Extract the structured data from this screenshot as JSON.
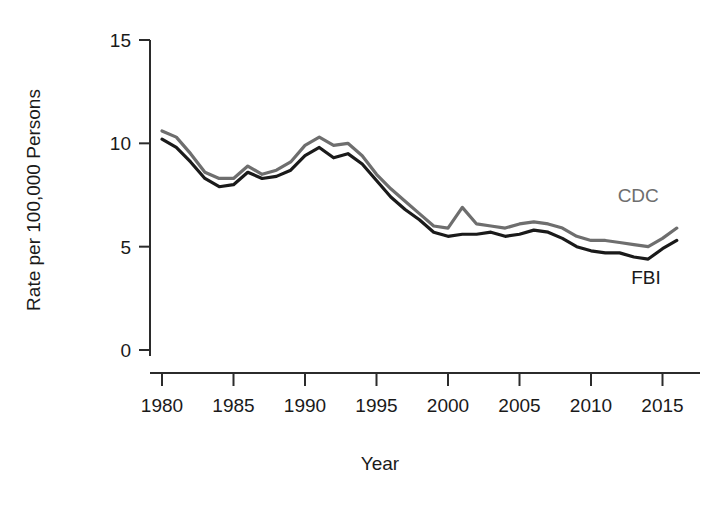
{
  "chart_data": {
    "type": "line",
    "title": "",
    "xlabel": "Year",
    "ylabel": "Rate per 100,000 Persons",
    "xlim": [
      1980,
      2016
    ],
    "ylim": [
      0,
      15
    ],
    "xticks": [
      1980,
      1985,
      1990,
      1995,
      2000,
      2005,
      2010,
      2015
    ],
    "xtick_labels": [
      "1980",
      "1985",
      "1990",
      "1995",
      "2000",
      "2005",
      "2010",
      "2015"
    ],
    "yticks": [
      0,
      5,
      10,
      15
    ],
    "ytick_labels": [
      "0",
      "5",
      "10",
      "15"
    ],
    "grid": false,
    "legend_position": "inline-end-of-line",
    "x": [
      1980,
      1981,
      1982,
      1983,
      1984,
      1985,
      1986,
      1987,
      1988,
      1989,
      1990,
      1991,
      1992,
      1993,
      1994,
      1995,
      1996,
      1997,
      1998,
      1999,
      2000,
      2001,
      2002,
      2003,
      2004,
      2005,
      2006,
      2007,
      2008,
      2009,
      2010,
      2011,
      2012,
      2013,
      2014,
      2015,
      2016
    ],
    "series": [
      {
        "name": "CDC",
        "label": "CDC",
        "color": "#6e6e6e",
        "values": [
          10.6,
          10.3,
          9.5,
          8.6,
          8.3,
          8.3,
          8.9,
          8.5,
          8.7,
          9.1,
          9.9,
          10.3,
          9.9,
          10.0,
          9.4,
          8.5,
          7.8,
          7.2,
          6.6,
          6.0,
          5.9,
          6.9,
          6.1,
          6.0,
          5.9,
          6.1,
          6.2,
          6.1,
          5.9,
          5.5,
          5.3,
          5.3,
          5.2,
          5.1,
          5.0,
          5.4,
          5.9
        ]
      },
      {
        "name": "FBI",
        "label": "FBI",
        "color": "#1a1a1a",
        "values": [
          10.2,
          9.8,
          9.1,
          8.3,
          7.9,
          8.0,
          8.6,
          8.3,
          8.4,
          8.7,
          9.4,
          9.8,
          9.3,
          9.5,
          9.0,
          8.2,
          7.4,
          6.8,
          6.3,
          5.7,
          5.5,
          5.6,
          5.6,
          5.7,
          5.5,
          5.6,
          5.8,
          5.7,
          5.4,
          5.0,
          4.8,
          4.7,
          4.7,
          4.5,
          4.4,
          4.9,
          5.3
        ]
      }
    ]
  },
  "axes": {
    "x_axis_name": "year-axis",
    "y_axis_name": "rate-axis"
  }
}
